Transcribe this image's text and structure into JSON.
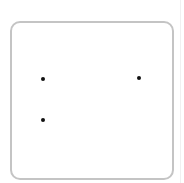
{
  "die": {
    "pip_count": 3,
    "pips": [
      {
        "x": 43,
        "y": 79
      },
      {
        "x": 139,
        "y": 78
      },
      {
        "x": 43,
        "y": 120
      }
    ],
    "border_color": "#c4c4c4",
    "pip_color": "#111111"
  }
}
